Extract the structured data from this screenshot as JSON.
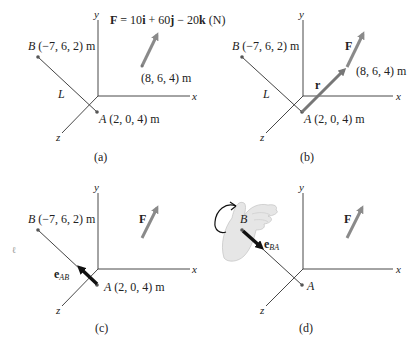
{
  "figure": {
    "panels": [
      {
        "id": "a",
        "caption": "(a)",
        "axes": {
          "x": "x",
          "y": "y",
          "z": "z"
        },
        "force_equation_parts": {
          "F": "F",
          "eq": " = 10",
          "i": "i",
          "plus": " + 60",
          "j": "j",
          "minus": " − 20",
          "k": "k",
          "unit": " (N)"
        },
        "point_B": {
          "letter": "B",
          "coords": " (−7, 6, 2) m"
        },
        "point_A": {
          "letter": "A",
          "coords": " (2, 0, 4) m"
        },
        "force_point": "(8, 6, 4) m",
        "rod_label": "L"
      },
      {
        "id": "b",
        "caption": "(b)",
        "axes": {
          "x": "x",
          "y": "y",
          "z": "z"
        },
        "point_B": {
          "letter": "B",
          "coords": " (−7, 6, 2) m"
        },
        "point_A": {
          "letter": "A",
          "coords": " (2, 0, 4) m"
        },
        "force_point": "(8, 6, 4) m",
        "force_label": "F",
        "position_vector_label": "r",
        "rod_label": "L"
      },
      {
        "id": "c",
        "caption": "(c)",
        "axes": {
          "x": "x",
          "y": "y",
          "z": "z"
        },
        "point_B": {
          "letter": "B",
          "coords": " (−7, 6, 2) m"
        },
        "point_A": {
          "letter": "A",
          "coords": " (2, 0, 4) m"
        },
        "force_label": "F",
        "unit_vector": {
          "base": "e",
          "sub": "AB"
        }
      },
      {
        "id": "d",
        "caption": "(d)",
        "axes": {
          "x": "x",
          "y": "y",
          "z": "z"
        },
        "point_B": {
          "letter": "B"
        },
        "point_A": {
          "letter": "A"
        },
        "force_label": "F",
        "unit_vector": {
          "base": "e",
          "sub": "BA"
        },
        "hand_icon": "right-hand-rule"
      }
    ]
  },
  "colors": {
    "force": "#8a8a8a",
    "axis": "#333333",
    "unit_vector": "#111111",
    "hand": "#e6e6e6"
  }
}
